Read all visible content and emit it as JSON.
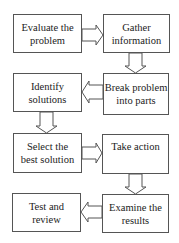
{
  "diagram": {
    "type": "flowchart",
    "nodes": [
      {
        "id": "evaluate",
        "lines": [
          "Evaluate the",
          "problem"
        ]
      },
      {
        "id": "gather",
        "lines": [
          "Gather",
          "information"
        ]
      },
      {
        "id": "break",
        "lines": [
          "Break problem",
          "into parts"
        ]
      },
      {
        "id": "identify",
        "lines": [
          "Identify",
          "solutions"
        ]
      },
      {
        "id": "select",
        "lines": [
          "Select the",
          "best solution"
        ]
      },
      {
        "id": "action",
        "lines": [
          "Take action"
        ]
      },
      {
        "id": "examine",
        "lines": [
          "Examine the",
          "results"
        ]
      },
      {
        "id": "test",
        "lines": [
          "Test and",
          "review"
        ]
      }
    ],
    "edges": [
      {
        "from": "evaluate",
        "to": "gather",
        "direction": "right"
      },
      {
        "from": "gather",
        "to": "break",
        "direction": "down"
      },
      {
        "from": "break",
        "to": "identify",
        "direction": "left"
      },
      {
        "from": "identify",
        "to": "select",
        "direction": "down"
      },
      {
        "from": "select",
        "to": "action",
        "direction": "right"
      },
      {
        "from": "action",
        "to": "examine",
        "direction": "down"
      },
      {
        "from": "examine",
        "to": "test",
        "direction": "left"
      }
    ],
    "colors": {
      "stroke": "#555555",
      "text": "#222222",
      "background": "#ffffff"
    }
  }
}
